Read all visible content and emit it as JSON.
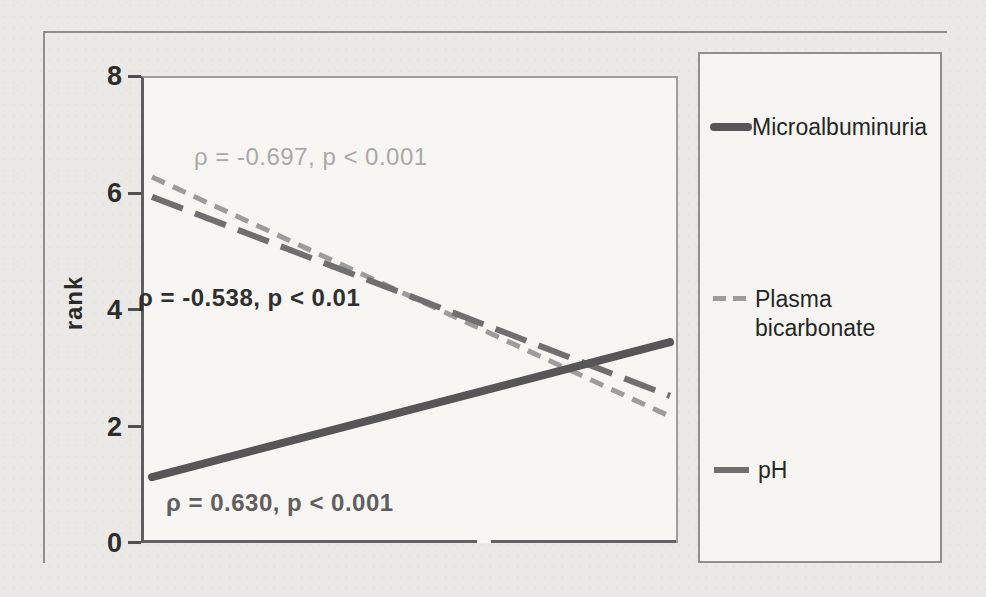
{
  "figure": {
    "accent_colors": {
      "microalbuminuria_line": "#565656",
      "plasma_bicarbonate_line": "#9c9c9c",
      "ph_line": "#6f6f6f"
    }
  },
  "legend": {
    "items": [
      {
        "label": "Microalbuminuria",
        "style": "solid-thick",
        "color": "#565656"
      },
      {
        "label": "Plasma bicarbonate",
        "style": "dash-short",
        "color": "#9c9c9c"
      },
      {
        "label": "pH",
        "style": "dash-long",
        "color": "#6f6f6f"
      }
    ]
  },
  "chart_data": {
    "type": "line",
    "title": "",
    "xlabel": "",
    "ylabel": "rank",
    "ylim": [
      0,
      8
    ],
    "yticks": [
      0,
      2,
      4,
      6,
      8
    ],
    "xticks": [],
    "grid": false,
    "legend_position": "right-box",
    "series": [
      {
        "name": "Microalbuminuria",
        "style": "solid-thick",
        "color": "#565656",
        "trend": "increasing",
        "start_rank": 1.13,
        "end_rank": 3.44,
        "correlation": "ρ = 0.630, p < 0.001"
      },
      {
        "name": "Plasma bicarbonate",
        "style": "dash-short",
        "color": "#9c9c9c",
        "trend": "decreasing",
        "start_rank": 6.27,
        "end_rank": 2.17,
        "correlation": "ρ = -0.697, p < 0.001"
      },
      {
        "name": "pH",
        "style": "dash-long",
        "color": "#6f6f6f",
        "trend": "decreasing",
        "start_rank": 5.93,
        "end_rank": 2.52,
        "correlation": "ρ = -0.538, p < 0.01"
      }
    ],
    "annotations": [
      {
        "text": "ρ = -0.697, p < 0.001",
        "color": "#a9a9a9",
        "bold": false,
        "refers_to": "Plasma bicarbonate"
      },
      {
        "text": "ρ = -0.538, p < 0.01",
        "color": "#2f2f2f",
        "bold": true,
        "refers_to": "pH"
      },
      {
        "text": "ρ = 0.630, p < 0.001",
        "color": "#5f5f5f",
        "bold": true,
        "refers_to": "Microalbuminuria"
      }
    ]
  }
}
